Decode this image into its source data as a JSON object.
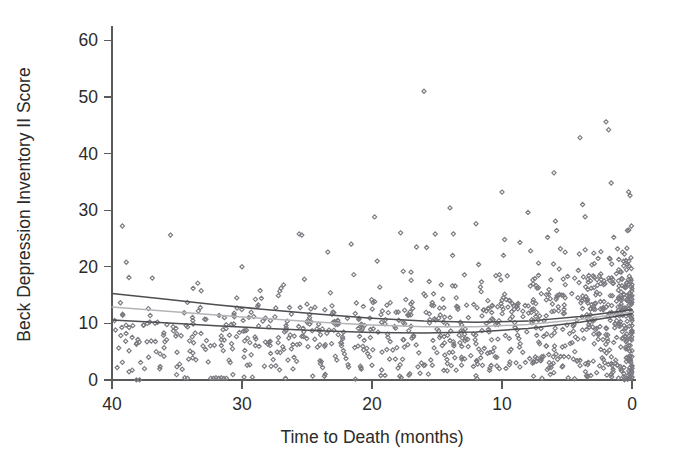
{
  "chart_data": {
    "type": "scatter",
    "title": "",
    "subtitle": "",
    "xlabel": "Time to Death (months)",
    "ylabel": "Beck Depression Inventory II Score",
    "xlim": [
      40,
      0
    ],
    "ylim": [
      0,
      62
    ],
    "x_reversed": true,
    "grid": false,
    "legend": false,
    "legend_position": "none",
    "x_ticks": [
      40,
      30,
      20,
      10,
      0
    ],
    "x_tick_labels": [
      "40",
      "30",
      "20",
      "10",
      "0"
    ],
    "y_ticks": [
      0,
      10,
      20,
      30,
      40,
      50,
      60
    ],
    "y_tick_labels": [
      "0",
      "10",
      "20",
      "30",
      "40",
      "50",
      "60"
    ],
    "marker": {
      "shape": "open-diamond",
      "color": "#7a7a80",
      "size": 4.2,
      "fill": "none"
    },
    "point_count": 1030,
    "series": [
      {
        "name": "Beck Depression Inventory II Score",
        "type": "scatter",
        "color": "#7a7a80",
        "points": [
          [
            39.8,
            10.5
          ],
          [
            39.6,
            2.2
          ],
          [
            39.2,
            27.2
          ],
          [
            38.9,
            20.8
          ],
          [
            38.7,
            18.1
          ],
          [
            38.4,
            9.6
          ],
          [
            38.1,
            6.5
          ],
          [
            37.8,
            3.1
          ],
          [
            37.5,
            2.0
          ],
          [
            37.2,
            12.6
          ],
          [
            36.9,
            18.0
          ],
          [
            36.6,
            5.0
          ],
          [
            36.3,
            4.6
          ],
          [
            36.0,
            4.2
          ],
          [
            35.8,
            7.1
          ],
          [
            35.5,
            25.6
          ],
          [
            35.3,
            9.4
          ],
          [
            35.0,
            4.9
          ],
          [
            34.8,
            2.8
          ],
          [
            34.6,
            1.9
          ],
          [
            34.4,
            0.4
          ],
          [
            34.2,
            0.3
          ],
          [
            34.0,
            5.1
          ],
          [
            33.8,
            3.9
          ],
          [
            33.6,
            8.3
          ],
          [
            33.4,
            17.1
          ],
          [
            33.2,
            12.8
          ],
          [
            33.0,
            6.0
          ],
          [
            32.8,
            5.4
          ],
          [
            32.6,
            3.2
          ],
          [
            32.4,
            0.3
          ],
          [
            32.2,
            0.3
          ],
          [
            32.0,
            0.4
          ],
          [
            31.8,
            0.3
          ],
          [
            31.6,
            0.4
          ],
          [
            31.4,
            0.3
          ],
          [
            31.2,
            0.3
          ],
          [
            31.0,
            3.5
          ],
          [
            30.8,
            6.4
          ],
          [
            30.6,
            11.8
          ],
          [
            30.4,
            14.5
          ],
          [
            30.2,
            8.4
          ],
          [
            30.0,
            20.0
          ],
          [
            29.8,
            6.9
          ],
          [
            29.6,
            2.6
          ],
          [
            29.4,
            2.7
          ],
          [
            29.2,
            0.5
          ],
          [
            29.0,
            7.6
          ],
          [
            28.8,
            13.0
          ],
          [
            28.6,
            15.8
          ],
          [
            28.4,
            10.4
          ],
          [
            28.2,
            6.7
          ],
          [
            28.0,
            6.3
          ],
          [
            27.8,
            4.7
          ],
          [
            27.6,
            3.6
          ],
          [
            27.4,
            2.5
          ],
          [
            27.2,
            14.9
          ],
          [
            27.0,
            16.2
          ],
          [
            26.8,
            16.8
          ],
          [
            26.6,
            9.2
          ],
          [
            26.4,
            7.4
          ],
          [
            26.2,
            5.5
          ],
          [
            26.0,
            4.0
          ],
          [
            25.8,
            3.3
          ],
          [
            25.6,
            25.8
          ],
          [
            25.4,
            25.6
          ],
          [
            25.2,
            17.8
          ],
          [
            25.0,
            13.4
          ],
          [
            24.8,
            11.0
          ],
          [
            24.6,
            8.7
          ],
          [
            24.4,
            7.2
          ],
          [
            24.2,
            5.8
          ],
          [
            24.0,
            3.4
          ],
          [
            23.8,
            2.2
          ],
          [
            23.6,
            1.0
          ],
          [
            23.4,
            22.6
          ],
          [
            23.2,
            15.4
          ],
          [
            23.0,
            12.0
          ],
          [
            22.8,
            9.8
          ],
          [
            22.6,
            8.0
          ],
          [
            22.4,
            6.6
          ],
          [
            22.2,
            5.2
          ],
          [
            22.0,
            3.8
          ],
          [
            21.8,
            2.3
          ],
          [
            21.6,
            24.0
          ],
          [
            21.4,
            18.6
          ],
          [
            21.2,
            13.6
          ],
          [
            21.0,
            10.9
          ],
          [
            20.8,
            8.8
          ],
          [
            20.6,
            7.0
          ],
          [
            20.4,
            5.6
          ],
          [
            20.2,
            4.1
          ],
          [
            20.0,
            2.6
          ],
          [
            19.8,
            28.8
          ],
          [
            19.6,
            21.0
          ],
          [
            19.4,
            16.4
          ],
          [
            19.2,
            12.2
          ],
          [
            19.0,
            9.9
          ],
          [
            18.8,
            8.1
          ],
          [
            18.6,
            6.8
          ],
          [
            18.4,
            5.3
          ],
          [
            18.2,
            3.7
          ],
          [
            18.0,
            2.1
          ],
          [
            17.8,
            26.0
          ],
          [
            17.6,
            19.2
          ],
          [
            17.4,
            14.2
          ],
          [
            17.2,
            11.4
          ],
          [
            17.0,
            9.5
          ],
          [
            16.8,
            7.8
          ],
          [
            16.6,
            6.2
          ],
          [
            16.4,
            4.8
          ],
          [
            16.2,
            3.0
          ],
          [
            16.0,
            51.0
          ],
          [
            15.8,
            23.4
          ],
          [
            15.6,
            17.4
          ],
          [
            15.4,
            13.2
          ],
          [
            15.2,
            10.8
          ],
          [
            15.0,
            9.0
          ],
          [
            14.8,
            7.5
          ],
          [
            14.6,
            6.1
          ],
          [
            14.4,
            4.4
          ],
          [
            14.2,
            2.9
          ],
          [
            14.0,
            30.4
          ],
          [
            13.8,
            22.0
          ],
          [
            13.6,
            16.6
          ],
          [
            13.4,
            12.9
          ],
          [
            13.2,
            10.2
          ],
          [
            13.0,
            8.6
          ],
          [
            12.8,
            7.3
          ],
          [
            12.6,
            5.9
          ],
          [
            12.4,
            4.3
          ],
          [
            12.2,
            2.4
          ],
          [
            12.0,
            27.6
          ],
          [
            11.8,
            20.4
          ],
          [
            11.6,
            15.6
          ],
          [
            11.4,
            12.4
          ],
          [
            11.2,
            10.0
          ],
          [
            11.0,
            8.5
          ],
          [
            10.8,
            7.1
          ],
          [
            10.6,
            5.7
          ],
          [
            10.4,
            4.0
          ],
          [
            10.2,
            2.0
          ],
          [
            10.0,
            33.2
          ],
          [
            9.8,
            24.8
          ],
          [
            9.6,
            18.4
          ],
          [
            9.4,
            14.0
          ],
          [
            9.2,
            11.2
          ],
          [
            9.0,
            9.3
          ],
          [
            8.8,
            7.9
          ],
          [
            8.6,
            6.4
          ],
          [
            8.4,
            4.9
          ],
          [
            8.2,
            3.1
          ],
          [
            8.0,
            29.6
          ],
          [
            7.8,
            22.8
          ],
          [
            7.6,
            17.0
          ],
          [
            7.4,
            13.5
          ],
          [
            7.2,
            10.6
          ],
          [
            7.0,
            9.1
          ],
          [
            6.8,
            7.7
          ],
          [
            6.6,
            6.0
          ],
          [
            6.4,
            4.5
          ],
          [
            6.2,
            2.7
          ],
          [
            6.0,
            36.6
          ],
          [
            5.8,
            26.4
          ],
          [
            5.6,
            19.6
          ],
          [
            5.4,
            15.0
          ],
          [
            5.2,
            11.8
          ],
          [
            5.0,
            9.7
          ],
          [
            4.8,
            8.2
          ],
          [
            4.6,
            6.6
          ],
          [
            4.4,
            5.0
          ],
          [
            4.2,
            3.4
          ],
          [
            4.0,
            42.8
          ],
          [
            3.8,
            31.0
          ],
          [
            3.6,
            23.0
          ],
          [
            3.4,
            16.0
          ],
          [
            3.2,
            12.6
          ],
          [
            3.0,
            10.4
          ],
          [
            2.8,
            8.9
          ],
          [
            2.6,
            7.2
          ],
          [
            2.4,
            5.4
          ],
          [
            2.2,
            3.6
          ],
          [
            2.0,
            45.6
          ],
          [
            1.8,
            44.2
          ],
          [
            1.6,
            34.8
          ],
          [
            1.4,
            25.2
          ],
          [
            1.2,
            18.8
          ],
          [
            1.0,
            14.4
          ],
          [
            0.8,
            11.6
          ],
          [
            0.6,
            9.6
          ],
          [
            0.4,
            7.0
          ],
          [
            0.2,
            4.2
          ],
          [
            0.1,
            1.8
          ]
        ]
      }
    ],
    "trend_lines": [
      {
        "name": "upper-trend",
        "color": "#4d4d52",
        "style": "solid",
        "curve": "quadratic",
        "points": [
          [
            40,
            15.3
          ],
          [
            36,
            14.3
          ],
          [
            32,
            13.3
          ],
          [
            28,
            12.4
          ],
          [
            24,
            11.6
          ],
          [
            20,
            10.9
          ],
          [
            16,
            10.4
          ],
          [
            12,
            10.2
          ],
          [
            8,
            10.4
          ],
          [
            4,
            11.2
          ],
          [
            0,
            12.4
          ]
        ]
      },
      {
        "name": "middle-trend",
        "color": "#b4b4b8",
        "style": "solid",
        "curve": "quadratic",
        "points": [
          [
            40,
            12.9
          ],
          [
            36,
            12.2
          ],
          [
            32,
            11.5
          ],
          [
            28,
            10.8
          ],
          [
            24,
            10.2
          ],
          [
            20,
            9.7
          ],
          [
            16,
            9.4
          ],
          [
            12,
            9.4
          ],
          [
            8,
            9.8
          ],
          [
            4,
            10.7
          ],
          [
            0,
            12.0
          ]
        ]
      },
      {
        "name": "lower-trend",
        "color": "#4d4d52",
        "style": "solid",
        "curve": "quadratic",
        "points": [
          [
            40,
            10.6
          ],
          [
            36,
            10.1
          ],
          [
            32,
            9.6
          ],
          [
            28,
            9.1
          ],
          [
            24,
            8.7
          ],
          [
            20,
            8.4
          ],
          [
            16,
            8.3
          ],
          [
            12,
            8.5
          ],
          [
            8,
            9.1
          ],
          [
            4,
            10.2
          ],
          [
            0,
            11.7
          ]
        ]
      }
    ],
    "colors": {
      "marker": "#7a7a80",
      "axis": "#5a5a5a",
      "text": "#2b2b2b",
      "trend_dark": "#4d4d52",
      "trend_light": "#b4b4b8",
      "background": "#ffffff"
    }
  }
}
